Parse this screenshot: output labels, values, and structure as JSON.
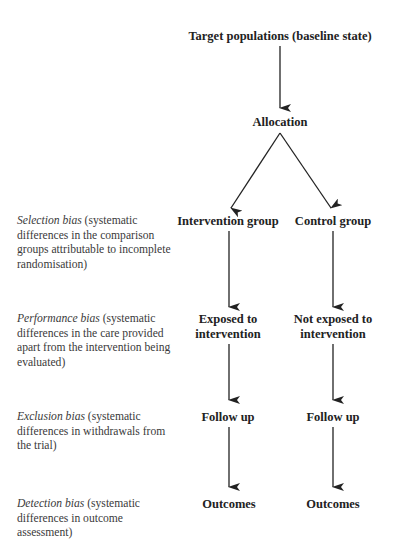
{
  "diagram": {
    "root": "Target populations (baseline state)",
    "allocation": "Allocation",
    "columns": [
      {
        "group": "Intervention group",
        "exposure_line1": "Exposed to",
        "exposure_line2": "intervention",
        "follow_up": "Follow up",
        "outcomes": "Outcomes"
      },
      {
        "group": "Control group",
        "exposure_line1": "Not exposed to",
        "exposure_line2": "intervention",
        "follow_up": "Follow up",
        "outcomes": "Outcomes"
      }
    ],
    "biases": [
      {
        "name": "Selection bias",
        "description": " (systematic differences in the comparison groups attributable to incomplete randomisation)"
      },
      {
        "name": "Performance bias",
        "description": " (systematic differences in the care provided apart from the intervention being evaluated)"
      },
      {
        "name": "Exclusion bias",
        "description": " (systematic differences in withdrawals from the trial)"
      },
      {
        "name": "Detection bias",
        "description": " (systematic differences in outcome assessment)"
      }
    ],
    "edges": [
      {
        "from": "Target populations (baseline state)",
        "to": "Allocation"
      },
      {
        "from": "Allocation",
        "to": "Intervention group"
      },
      {
        "from": "Allocation",
        "to": "Control group"
      },
      {
        "from": "Intervention group",
        "to": "Exposed to intervention"
      },
      {
        "from": "Control group",
        "to": "Not exposed to intervention"
      },
      {
        "from": "Exposed to intervention",
        "to": "Follow up (intervention)"
      },
      {
        "from": "Not exposed to intervention",
        "to": "Follow up (control)"
      },
      {
        "from": "Follow up (intervention)",
        "to": "Outcomes (intervention)"
      },
      {
        "from": "Follow up (control)",
        "to": "Outcomes (control)"
      }
    ],
    "colors": {
      "text": "#222222",
      "arrow": "#222222",
      "background": "#ffffff"
    }
  }
}
